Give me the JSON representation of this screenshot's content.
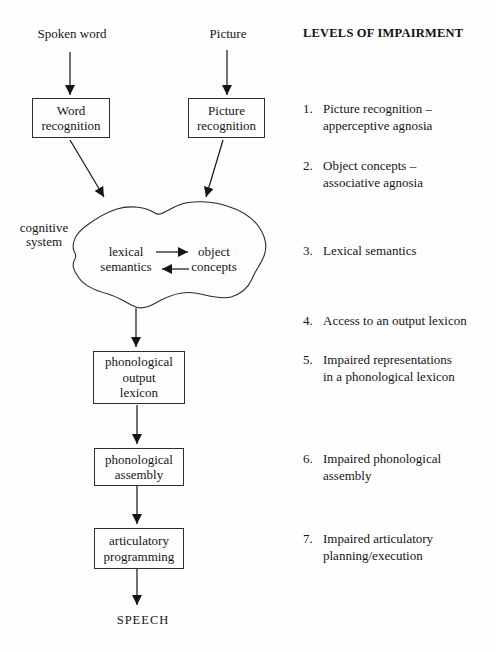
{
  "flow": {
    "spoken_word_label": "Spoken word",
    "picture_label": "Picture",
    "word_recognition": "Word\nrecognition",
    "picture_recognition": "Picture\nrecognition",
    "cognitive_system_label": "cognitive\nsystem",
    "lexical_semantics": "lexical\nsemantics",
    "object_concepts": "object\nconcepts",
    "phonological_output_lexicon": "phonological\noutput\nlexicon",
    "phonological_assembly": "phonological\nassembly",
    "articulatory_programming": "articulatory\nprogramming",
    "speech_label": "SPEECH"
  },
  "impairments": {
    "heading": "LEVELS OF IMPAIRMENT",
    "items": [
      {
        "num": "1.",
        "text": "Picture recognition –\napperceptive agnosia"
      },
      {
        "num": "2.",
        "text": "Object concepts –\nassociative agnosia"
      },
      {
        "num": "3.",
        "text": "Lexical semantics"
      },
      {
        "num": "4.",
        "text": "Access to an output lexicon"
      },
      {
        "num": "5.",
        "text": "Impaired representations\nin a phonological lexicon"
      },
      {
        "num": "6.",
        "text": "Impaired phonological\nassembly"
      },
      {
        "num": "7.",
        "text": "Impaired articulatory\nplanning/execution"
      }
    ]
  },
  "colors": {
    "ink": "#1a1a1a",
    "background": "#fefefe"
  }
}
